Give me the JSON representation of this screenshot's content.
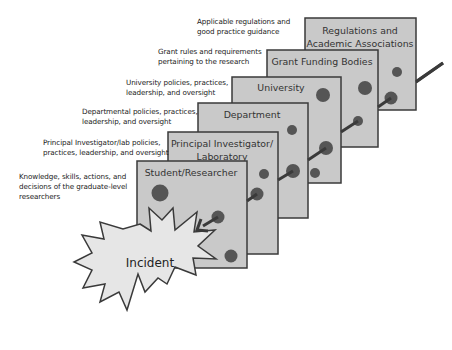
{
  "diagram": {
    "type": "swiss-cheese-layers",
    "colors": {
      "panel_fill": "#c9c9c9",
      "panel_stroke": "#3a3a3a",
      "hole_fill": "#555555",
      "arrow": "#3a3a3a",
      "incident_fill": "#e6e6e6"
    },
    "layers": [
      {
        "title_lines": [
          "Regulations and",
          "Academic Associations"
        ],
        "description": "Applicable regulations and good practice guidance",
        "desc_lines": [
          "Applicable regulations and",
          "good practice guidance"
        ]
      },
      {
        "title_lines": [
          "Grant Funding Bodies"
        ],
        "description": "Grant rules and requirements pertaining to the research",
        "desc_lines": [
          "Grant rules and requirements",
          "pertaining to the research"
        ]
      },
      {
        "title_lines": [
          "University"
        ],
        "description": "University policies, practices, leadership, and oversight",
        "desc_lines": [
          "University policies, practices,",
          "leadership, and oversight"
        ]
      },
      {
        "title_lines": [
          "Department"
        ],
        "description": "Departmental policies, practices, leadership, and oversight",
        "desc_lines": [
          "Departmental policies, practices,",
          "leadership, and oversight"
        ]
      },
      {
        "title_lines": [
          "Principal Investigator/",
          "Laboratory"
        ],
        "description": "Principal Investigator/lab policies, practices, leadership, and oversight",
        "desc_lines": [
          "Principal Investigator/lab policies,",
          "practices, leadership, and oversight"
        ]
      },
      {
        "title_lines": [
          "Student/Researcher"
        ],
        "description": "Knowledge, skills, actions, and decisions of the graduate-level researchers",
        "desc_lines": [
          "Knowledge, skills, actions, and",
          "decisions of the graduate-level",
          "researchers"
        ]
      }
    ],
    "incident": {
      "label": "Incident"
    }
  }
}
